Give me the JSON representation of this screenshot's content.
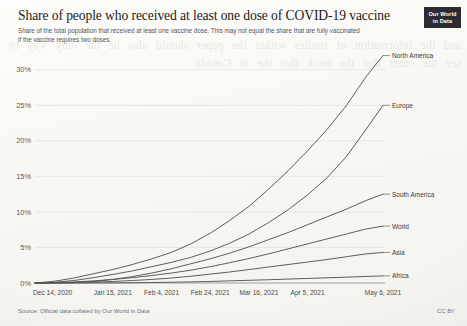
{
  "header": {
    "title": "Share of people who received at least one dose of COVID-19 vaccine",
    "subtitle": "Share of the total population that received at least one vaccine dose. This may not equal the share that are fully vaccinated if the vaccine requires two doses.",
    "logo_line1": "Our World",
    "logo_line2": "in Data"
  },
  "footer": {
    "source": "Source: Official data collated by Our World in Data",
    "license": "CC BY"
  },
  "showthrough_text": "and the information of studies within the paper should also be the only way to see the other that the book that the in Canada",
  "chart_data": {
    "type": "line",
    "title": "Share of people who received at least one dose of COVID-19 vaccine",
    "subtitle": "Share of the total population that received at least one vaccine dose. This may not equal the share that are fully vaccinated if the vaccine requires two doses.",
    "xlabel": "",
    "ylabel": "",
    "ylim": [
      0,
      32.5
    ],
    "xlim": [
      "Dec 14, 2020",
      "May 6, 2021"
    ],
    "grid": true,
    "legend_position": "right-inline",
    "y_ticks": [
      "0%",
      "5%",
      "10%",
      "15%",
      "20%",
      "25%",
      "30%"
    ],
    "y_tick_values": [
      0,
      5,
      10,
      15,
      20,
      25,
      30
    ],
    "x_ticks": [
      "Dec 14, 2020",
      "Jan 15, 2021",
      "Feb 4, 2021",
      "Feb 24, 2021",
      "Mar 16, 2021",
      "Apr 5, 2021",
      "May 6, 2021"
    ],
    "x_tick_days": [
      0,
      32,
      52,
      72,
      92,
      112,
      143
    ],
    "total_days": 143,
    "series": [
      {
        "name": "North America",
        "label_value": "32.0%",
        "x_days": [
          0,
          8,
          16,
          24,
          32,
          40,
          48,
          56,
          64,
          72,
          80,
          88,
          96,
          104,
          112,
          120,
          128,
          136,
          143
        ],
        "values": [
          0.0,
          0.25,
          0.7,
          1.3,
          1.9,
          2.6,
          3.4,
          4.3,
          5.5,
          7.0,
          8.8,
          10.8,
          13.2,
          15.8,
          18.6,
          21.6,
          25.0,
          29.0,
          32.0
        ]
      },
      {
        "name": "Europe",
        "label_value": "25.0%",
        "x_days": [
          0,
          8,
          16,
          24,
          32,
          40,
          48,
          56,
          64,
          72,
          80,
          88,
          96,
          104,
          112,
          120,
          128,
          136,
          143
        ],
        "values": [
          0.0,
          0.1,
          0.35,
          0.75,
          1.2,
          1.7,
          2.3,
          2.9,
          3.6,
          4.5,
          5.6,
          6.9,
          8.5,
          10.3,
          12.4,
          14.8,
          17.8,
          21.6,
          25.0
        ]
      },
      {
        "name": "South America",
        "label_value": "12.5%",
        "x_days": [
          0,
          8,
          16,
          24,
          32,
          40,
          48,
          56,
          64,
          72,
          80,
          88,
          96,
          104,
          112,
          120,
          128,
          136,
          143
        ],
        "values": [
          0.0,
          0.0,
          0.05,
          0.2,
          0.5,
          0.9,
          1.4,
          2.0,
          2.7,
          3.4,
          4.2,
          5.1,
          6.1,
          7.1,
          8.2,
          9.3,
          10.4,
          11.6,
          12.5
        ]
      },
      {
        "name": "World",
        "label_value": "8.0%",
        "x_days": [
          0,
          8,
          16,
          24,
          32,
          40,
          48,
          56,
          64,
          72,
          80,
          88,
          96,
          104,
          112,
          120,
          128,
          136,
          143
        ],
        "values": [
          0.0,
          0.05,
          0.15,
          0.3,
          0.5,
          0.75,
          1.05,
          1.4,
          1.8,
          2.3,
          2.85,
          3.45,
          4.1,
          4.8,
          5.5,
          6.2,
          6.9,
          7.6,
          8.0
        ]
      },
      {
        "name": "Asia",
        "label_value": "4.3%",
        "x_days": [
          0,
          8,
          16,
          24,
          32,
          40,
          48,
          56,
          64,
          72,
          80,
          88,
          96,
          104,
          112,
          120,
          128,
          136,
          143
        ],
        "values": [
          0.0,
          0.02,
          0.06,
          0.12,
          0.22,
          0.35,
          0.5,
          0.7,
          0.95,
          1.25,
          1.55,
          1.9,
          2.25,
          2.6,
          2.95,
          3.3,
          3.7,
          4.1,
          4.3
        ]
      },
      {
        "name": "Africa",
        "label_value": "1.0%",
        "x_days": [
          0,
          8,
          16,
          24,
          32,
          40,
          48,
          56,
          64,
          72,
          80,
          88,
          96,
          104,
          112,
          120,
          128,
          136,
          143
        ],
        "values": [
          0.0,
          0.0,
          0.0,
          0.01,
          0.02,
          0.04,
          0.07,
          0.11,
          0.16,
          0.22,
          0.3,
          0.38,
          0.46,
          0.55,
          0.64,
          0.73,
          0.82,
          0.92,
          1.0
        ]
      }
    ]
  }
}
